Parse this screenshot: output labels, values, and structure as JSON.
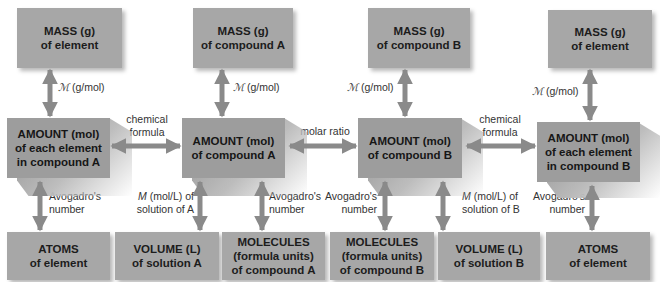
{
  "diagram": {
    "top_row": [
      {
        "line1": "MASS (g)",
        "line2": "of element"
      },
      {
        "line1": "MASS (g)",
        "line2": "of compound A"
      },
      {
        "line1": "MASS (g)",
        "line2": "of compound B"
      },
      {
        "line1": "MASS (g)",
        "line2": "of element"
      }
    ],
    "middle_row": [
      {
        "line1": "AMOUNT (mol)",
        "line2": "of each element",
        "line3": "in compound A"
      },
      {
        "line1": "AMOUNT (mol)",
        "line2": "of compound A"
      },
      {
        "line1": "AMOUNT (mol)",
        "line2": "of compound B"
      },
      {
        "line1": "AMOUNT (mol)",
        "line2": "of each element",
        "line3": "in compound B"
      }
    ],
    "bottom_row": [
      {
        "line1": "ATOMS",
        "line2": "of element"
      },
      {
        "line1": "VOLUME (L)",
        "line2": "of solution A"
      },
      {
        "line1": "MOLECULES",
        "line2": "(formula units)",
        "line3": "of compound A"
      },
      {
        "line1": "MOLECULES",
        "line2": "(formula units)",
        "line3": "of compound B"
      },
      {
        "line1": "VOLUME (L)",
        "line2": "of solution B"
      },
      {
        "line1": "ATOMS",
        "line2": "of element"
      }
    ],
    "horizontal_labels": {
      "left": {
        "line1": "chemical",
        "line2": "formula"
      },
      "center": {
        "line1": "molar ratio"
      },
      "right": {
        "line1": "chemical",
        "line2": "formula"
      }
    },
    "molar_mass_labels": [
      {
        "symbol": "ℳ",
        "unit": " (g/mol)"
      },
      {
        "symbol": "ℳ",
        "unit": " (g/mol)"
      },
      {
        "symbol": "ℳ",
        "unit": " (g/mol)"
      },
      {
        "symbol": "ℳ",
        "unit": " (g/mol)"
      }
    ],
    "bottom_labels": {
      "avogadro_1": {
        "line1": "Avogadro's",
        "line2": "number"
      },
      "molarity_a": {
        "symbol": "M",
        "line1_rest": " (mol/L) of",
        "line2": "solution of A"
      },
      "avogadro_2": {
        "line1": "Avogadro's",
        "line2": "number"
      },
      "avogadro_3": {
        "line1": "Avogadro's",
        "line2": "number"
      },
      "molarity_b": {
        "symbol": "M",
        "line1_rest": " (mol/L) of",
        "line2": "solution of B"
      },
      "avogadro_4": {
        "line1": "Avogadro's",
        "line2": "number"
      }
    },
    "colors": {
      "box_fill": "#a7a7a7",
      "middle_box_fill": "#9d9d9d",
      "arrow": "#8a8a8a",
      "text": "#1c1c1c"
    }
  }
}
